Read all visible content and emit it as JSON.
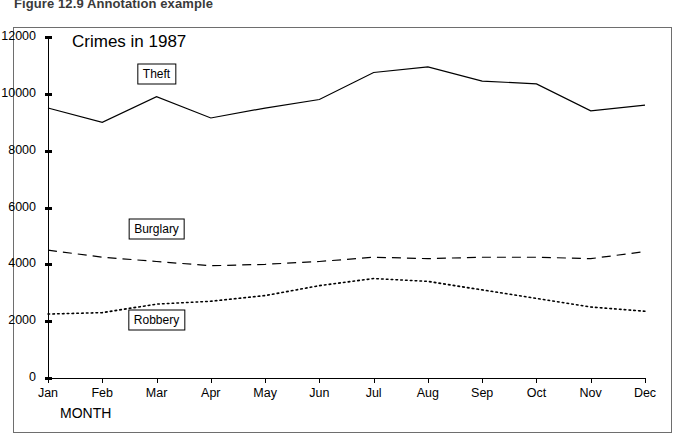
{
  "caption": "Figure 12.9 Annotation example",
  "chart_data": {
    "type": "line",
    "title": "Crimes in 1987",
    "xlabel": "MONTH",
    "ylabel": "",
    "categories": [
      "Jan",
      "Feb",
      "Mar",
      "Apr",
      "May",
      "Jun",
      "Jul",
      "Aug",
      "Sep",
      "Oct",
      "Nov",
      "Dec"
    ],
    "ylim": [
      0,
      12000
    ],
    "yticks": [
      0,
      2000,
      4000,
      6000,
      8000,
      10000,
      12000
    ],
    "grid": false,
    "legend_position": "inline-annotations",
    "series": [
      {
        "name": "Theft",
        "style": "solid",
        "color": "#000000",
        "values": [
          9500,
          9000,
          9900,
          9150,
          9500,
          9800,
          10750,
          10950,
          10450,
          10350,
          9400,
          9600
        ]
      },
      {
        "name": "Burglary",
        "style": "dashed",
        "color": "#000000",
        "values": [
          4500,
          4250,
          4100,
          3950,
          4000,
          4100,
          4250,
          4200,
          4250,
          4250,
          4200,
          4450
        ]
      },
      {
        "name": "Robbery",
        "style": "dotted",
        "color": "#000000",
        "values": [
          2250,
          2300,
          2600,
          2700,
          2900,
          3250,
          3500,
          3400,
          3100,
          2800,
          2500,
          2350
        ]
      }
    ],
    "annotations": [
      {
        "label": "Theft",
        "x_category": "Mar",
        "y_value": 10700
      },
      {
        "label": "Burglary",
        "x_category": "Mar",
        "y_value": 5250
      },
      {
        "label": "Robbery",
        "x_category": "Mar",
        "y_value": 2050
      }
    ]
  }
}
